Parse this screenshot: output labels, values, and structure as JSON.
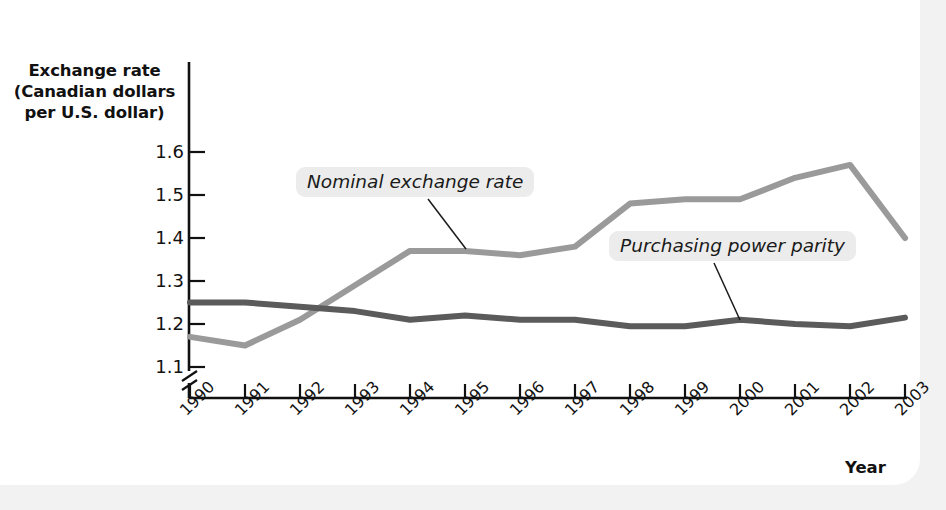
{
  "chart_data": {
    "type": "line",
    "title": "",
    "xlabel": "Year",
    "ylabel": "Exchange rate (Canadian dollars per U.S. dollar)",
    "ylabel_lines": [
      "Exchange rate",
      "(Canadian dollars",
      "per U.S. dollar)"
    ],
    "categories": [
      "1990",
      "1991",
      "1992",
      "1993",
      "1994",
      "1995",
      "1996",
      "1997",
      "1998",
      "1999",
      "2000",
      "2001",
      "2002",
      "2003"
    ],
    "yticks": [
      "1.1",
      "1.2",
      "1.3",
      "1.4",
      "1.5",
      "1.6"
    ],
    "ylim": [
      1.08,
      1.64
    ],
    "axis_break": true,
    "grid": false,
    "legend_position": "inline-annotations",
    "series": [
      {
        "name": "Nominal exchange rate",
        "color": "#9a9a9a",
        "values": [
          1.17,
          1.15,
          1.21,
          1.29,
          1.37,
          1.37,
          1.36,
          1.38,
          1.48,
          1.49,
          1.49,
          1.54,
          1.57,
          1.4
        ]
      },
      {
        "name": "Purchasing power parity",
        "color": "#5b5b5b",
        "values": [
          1.25,
          1.25,
          1.24,
          1.23,
          1.21,
          1.22,
          1.21,
          1.21,
          1.195,
          1.195,
          1.21,
          1.2,
          1.195,
          1.215
        ]
      }
    ],
    "annotations": [
      {
        "text": "Nominal exchange rate",
        "points_to_series": "Nominal exchange rate",
        "points_to_year": "1995"
      },
      {
        "text": "Purchasing power parity",
        "points_to_series": "Purchasing power parity",
        "points_to_year": "2000"
      }
    ]
  },
  "axis": {
    "x_title": "Year"
  }
}
